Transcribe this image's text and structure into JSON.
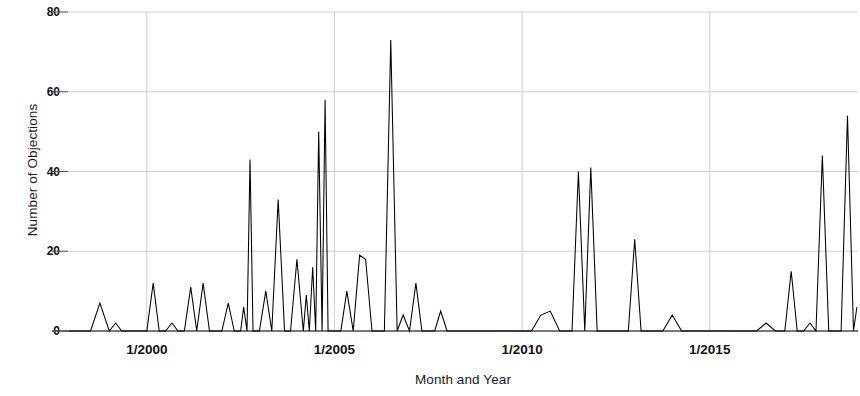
{
  "chart_data": {
    "type": "line",
    "title": "",
    "xlabel": "Month and Year",
    "ylabel": "Number of Objections",
    "xtick_labels": [
      "1/2000",
      "1/2005",
      "1/2010",
      "1/2015"
    ],
    "xtick_values": [
      2000.0,
      2005.0,
      2010.0,
      2015.0
    ],
    "ytick_labels": [
      "0",
      "20",
      "40",
      "60",
      "80"
    ],
    "ytick_values": [
      0,
      20,
      40,
      60,
      80
    ],
    "ylim": [
      0,
      80
    ],
    "xlim": [
      1997.9,
      2018.95
    ],
    "grid": true,
    "legend": "none",
    "line_color": "#000000",
    "gridline_color": "#c8c8c8",
    "background_color": "#ffffff",
    "series": [
      {
        "name": "Number of Objections",
        "x": [
          1997.92,
          1998.25,
          1998.5,
          1998.75,
          1999.0,
          1999.17,
          1999.33,
          1999.5,
          1999.67,
          1999.83,
          2000.0,
          2000.17,
          2000.33,
          2000.5,
          2000.67,
          2000.83,
          2001.0,
          2001.17,
          2001.33,
          2001.5,
          2001.67,
          2001.83,
          2002.0,
          2002.17,
          2002.33,
          2002.5,
          2002.58,
          2002.67,
          2002.75,
          2002.83,
          2003.0,
          2003.17,
          2003.33,
          2003.5,
          2003.67,
          2003.83,
          2004.0,
          2004.17,
          2004.25,
          2004.33,
          2004.42,
          2004.5,
          2004.58,
          2004.67,
          2004.75,
          2004.83,
          2004.92,
          2005.0,
          2005.17,
          2005.33,
          2005.5,
          2005.67,
          2005.83,
          2006.0,
          2006.17,
          2006.33,
          2006.5,
          2006.67,
          2006.83,
          2007.0,
          2007.17,
          2007.33,
          2007.5,
          2007.67,
          2007.83,
          2008.0,
          2008.17,
          2008.33,
          2008.5,
          2008.67,
          2008.83,
          2009.0,
          2009.25,
          2009.5,
          2009.75,
          2010.0,
          2010.25,
          2010.5,
          2010.75,
          2011.0,
          2011.17,
          2011.33,
          2011.5,
          2011.67,
          2011.83,
          2012.0,
          2012.17,
          2012.33,
          2012.5,
          2012.67,
          2012.83,
          2013.0,
          2013.17,
          2013.33,
          2013.5,
          2013.75,
          2014.0,
          2014.25,
          2014.5,
          2014.75,
          2015.0,
          2015.25,
          2015.5,
          2015.75,
          2016.0,
          2016.25,
          2016.5,
          2016.75,
          2017.0,
          2017.17,
          2017.33,
          2017.5,
          2017.67,
          2017.83,
          2018.0,
          2018.17,
          2018.33,
          2018.5,
          2018.67,
          2018.83,
          2018.92
        ],
        "values": [
          0,
          0,
          0,
          7,
          0,
          2,
          0,
          0,
          0,
          0,
          0,
          12,
          0,
          0,
          2,
          0,
          0,
          11,
          0,
          12,
          0,
          0,
          0,
          7,
          0,
          0,
          6,
          0,
          43,
          0,
          0,
          10,
          0,
          33,
          0,
          0,
          18,
          0,
          9,
          0,
          16,
          0,
          50,
          0,
          58,
          0,
          0,
          0,
          0,
          10,
          0,
          19,
          18,
          0,
          0,
          0,
          73,
          0,
          4,
          0,
          12,
          0,
          0,
          0,
          5,
          0,
          0,
          0,
          0,
          0,
          0,
          0,
          0,
          0,
          0,
          0,
          0,
          4,
          5,
          0,
          0,
          0,
          40,
          0,
          41,
          0,
          0,
          0,
          0,
          0,
          0,
          23,
          0,
          0,
          0,
          0,
          4,
          0,
          0,
          0,
          0,
          0,
          0,
          0,
          0,
          0,
          2,
          0,
          0,
          15,
          0,
          0,
          2,
          0,
          44,
          0,
          0,
          0,
          54,
          0,
          6
        ]
      }
    ],
    "notable_peaks": [
      {
        "label": "1/2000-era cluster",
        "approx_value": 12
      },
      {
        "label": "2002 peak",
        "approx_value": 43
      },
      {
        "label": "2003 peak",
        "approx_value": 33
      },
      {
        "label": "2004 peak",
        "approx_value": 50
      },
      {
        "label": "2004 peak",
        "approx_value": 58
      },
      {
        "label": "2006 maximum",
        "approx_value": 73
      },
      {
        "label": "2011 peak",
        "approx_value": 41
      },
      {
        "label": "2013 peak",
        "approx_value": 23
      },
      {
        "label": "2018 peak",
        "approx_value": 44
      },
      {
        "label": "2018 peak",
        "approx_value": 54
      }
    ]
  }
}
